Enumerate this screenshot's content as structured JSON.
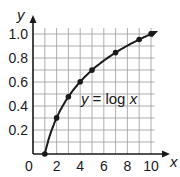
{
  "chart_data": {
    "type": "line",
    "title": "",
    "xlabel": "x",
    "ylabel": "y",
    "xlim": [
      0,
      10
    ],
    "ylim": [
      0,
      1.0
    ],
    "grid": true,
    "x_ticks": [
      0,
      2,
      4,
      6,
      8,
      10
    ],
    "x_tick_labels": [
      "0",
      "2",
      "4",
      "6",
      "8",
      "10"
    ],
    "y_ticks": [
      0.2,
      0.4,
      0.6,
      0.8,
      1.0
    ],
    "y_tick_labels": [
      "0.2",
      "0.4",
      "0.6",
      "0.8",
      "1.0"
    ],
    "annotations": [
      {
        "text": "y = log x",
        "x": 4.6,
        "y": 0.42
      }
    ],
    "series": [
      {
        "name": "y = log x",
        "x": [
          1,
          2,
          3,
          4,
          5,
          7,
          9,
          10
        ],
        "y": [
          0,
          0.301,
          0.477,
          0.602,
          0.699,
          0.845,
          0.954,
          1.0
        ],
        "markers": true
      }
    ]
  },
  "labels": {
    "x_axis": "x",
    "y_axis": "y",
    "equation_lhs": "y",
    "equation_rhs": "= log ",
    "equation_var": "x"
  }
}
